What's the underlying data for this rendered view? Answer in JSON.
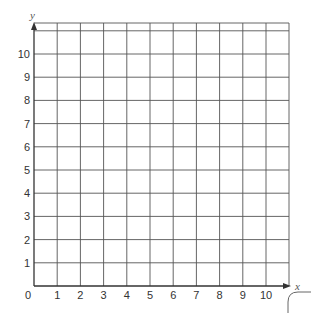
{
  "chart_data": {
    "type": "grid",
    "title": "",
    "xlabel": "x",
    "ylabel": "y",
    "xlim": [
      0,
      11
    ],
    "ylim": [
      0,
      11.3
    ],
    "x_ticks": [
      "0",
      "1",
      "2",
      "3",
      "4",
      "5",
      "6",
      "7",
      "8",
      "9",
      "10"
    ],
    "y_ticks": [
      "1",
      "2",
      "3",
      "4",
      "5",
      "6",
      "7",
      "8",
      "9",
      "10"
    ],
    "grid": true,
    "series": []
  },
  "colors": {
    "grid": "#555555",
    "axis": "#333333",
    "text": "#333333"
  }
}
